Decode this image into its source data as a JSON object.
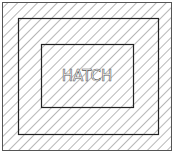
{
  "diagram": {
    "label": "HATCH",
    "hatch_spacing": 7,
    "line_color": "#333333",
    "hatch_color": "#777777"
  }
}
